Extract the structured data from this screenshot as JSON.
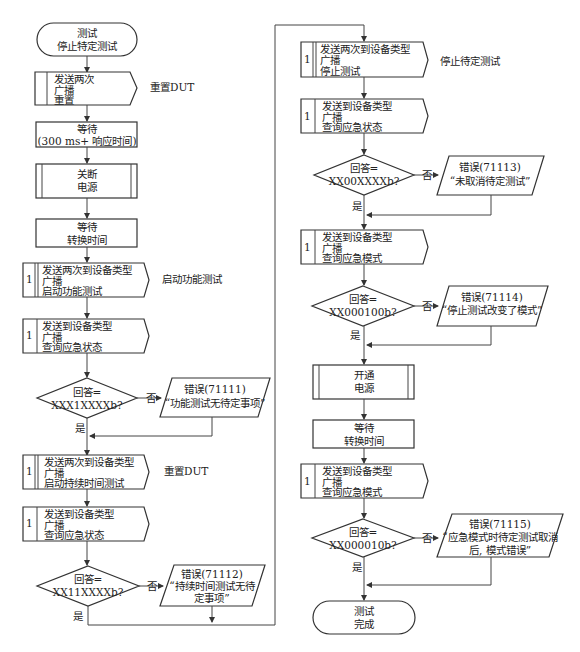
{
  "diagram": {
    "nodes": {
      "start": {
        "line1": "测试",
        "line2": "停止特定测试"
      },
      "send_reset": {
        "line1": "发送两次",
        "line2": "广播",
        "line3": "重置",
        "note": "重置DUT"
      },
      "wait1": {
        "line1": "等待",
        "line2": "(300  ms+ 响应时间)"
      },
      "power_off": {
        "line1": "关断",
        "line2": "电源"
      },
      "wait2": {
        "line1": "等待",
        "line2": "转换时间"
      },
      "start_func": {
        "num": "1",
        "line1": "发送两次到设备类型",
        "line2": "广播",
        "line3": "启动功能测试",
        "note": "启动功能测试"
      },
      "query_status1": {
        "num": "1",
        "line1": "发送到设备类型",
        "line2": "广播",
        "line3": "查询应急状态"
      },
      "dec1": {
        "line1": "回答=",
        "line2": "XXX1XXXXb?",
        "no": "否",
        "yes": "是"
      },
      "err1": {
        "line1": "错误(71111)",
        "line2": "“功能测试无待定事项”"
      },
      "start_duration": {
        "num": "1",
        "line1": "发送两次到设备类型",
        "line2": "广播",
        "line3": "启动持续时间测试",
        "note": "重置DUT"
      },
      "query_status2": {
        "num": "1",
        "line1": "发送到设备类型",
        "line2": "广播",
        "line3": "查询应急状态"
      },
      "dec2": {
        "line1": "回答=",
        "line2": "XX11XXXXb?",
        "no": "否",
        "yes": "是"
      },
      "err2": {
        "line1": "错误(71112)",
        "line2": "“持续时间测试无待",
        "line3": "定事项”"
      },
      "stop_test": {
        "num": "1",
        "line1": "发送两次到设备类型",
        "line2": "广播",
        "line3": "停止测试",
        "note": "停止待定测试"
      },
      "query_status3": {
        "num": "1",
        "line1": "发送到设备类型",
        "line2": "广播",
        "line3": "查询应急状态"
      },
      "dec3": {
        "line1": "回答=",
        "line2": "XX00XXXXb?",
        "no": "否",
        "yes": "是"
      },
      "err3": {
        "line1": "错误(71113)",
        "line2": "“未取消待定测试”"
      },
      "query_mode1": {
        "num": "1",
        "line1": "发送到设备类型",
        "line2": "广播",
        "line3": "查询应急模式"
      },
      "dec4": {
        "line1": "回答=",
        "line2": "XX000100b?",
        "no": "否",
        "yes": "是"
      },
      "err4": {
        "line1": "错误(71114)",
        "line2": "“停止测试改变了模式”"
      },
      "power_on": {
        "line1": "开通",
        "line2": "电源"
      },
      "wait3": {
        "line1": "等待",
        "line2": "转换时间"
      },
      "query_mode2": {
        "num": "1",
        "line1": "发送到设备类型",
        "line2": "广播",
        "line3": "查询应急模式"
      },
      "dec5": {
        "line1": "回答=",
        "line2": "XX000010b?",
        "no": "否",
        "yes": "是"
      },
      "err5": {
        "line1": "错误(71115)",
        "line2": "“应急模式时待定测试取消",
        "line3": "后, 模式错误”"
      },
      "end": {
        "line1": "测试",
        "line2": "完成"
      }
    }
  }
}
